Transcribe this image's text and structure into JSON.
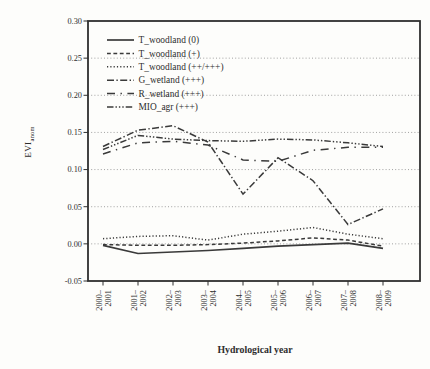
{
  "chart_data": {
    "type": "line",
    "title": "",
    "xlabel": "Hydrological year",
    "ylabel": "EVI",
    "ylabel_sub": "anom",
    "ylim": [
      -0.05,
      0.3
    ],
    "grid": "horizontal-dotted",
    "legend_position": "top-left-inside",
    "yticks": [
      {
        "label": "0.30",
        "value": 0.3
      },
      {
        "label": "0.25",
        "value": 0.25
      },
      {
        "label": "0.20",
        "value": 0.2
      },
      {
        "label": "0.15",
        "value": 0.15
      },
      {
        "label": "0.10",
        "value": 0.1
      },
      {
        "label": "0.05",
        "value": 0.05
      },
      {
        "label": "0.00",
        "value": 0.0
      },
      {
        "label": "-0.05",
        "value": -0.05
      }
    ],
    "categories": [
      "2000–2001",
      "2001–2002",
      "2002–2003",
      "2003–2004",
      "2004–2005",
      "2005–2006",
      "2006–2007",
      "2007–2008",
      "2008–2009"
    ],
    "series": [
      {
        "name": "T_woodland (0)",
        "dash": "solid",
        "values": [
          -0.002,
          -0.013,
          -0.011,
          -0.009,
          -0.006,
          -0.003,
          -0.001,
          0.001,
          -0.006
        ]
      },
      {
        "name": "T_woodland (+)",
        "dash": "dash",
        "values": [
          -0.001,
          -0.002,
          -0.002,
          -0.001,
          0.001,
          0.004,
          0.008,
          0.005,
          -0.003
        ]
      },
      {
        "name": "T_woodland (++/+++)",
        "dash": "dot",
        "values": [
          0.007,
          0.01,
          0.011,
          0.005,
          0.013,
          0.017,
          0.022,
          0.013,
          0.007
        ]
      },
      {
        "name": "G_wetland (+++)",
        "dash": "dashdot",
        "values": [
          0.131,
          0.153,
          0.159,
          0.137,
          0.067,
          0.116,
          0.085,
          0.026,
          0.047
        ]
      },
      {
        "name": "R_wetland (+++)",
        "dash": "longdashdot",
        "values": [
          0.121,
          0.136,
          0.138,
          0.133,
          0.113,
          0.111,
          0.126,
          0.13,
          0.13
        ]
      },
      {
        "name": "MIO_agr (+++)",
        "dash": "dashdotdotdot",
        "values": [
          0.127,
          0.146,
          0.141,
          0.139,
          0.138,
          0.141,
          0.14,
          0.136,
          0.131
        ]
      }
    ],
    "colors": {
      "line": "#3a3a3a",
      "grid": "#8a8a8a",
      "frame": "#2f2f2f",
      "text": "#2e2e2e",
      "background": "#fdfdfb"
    }
  }
}
